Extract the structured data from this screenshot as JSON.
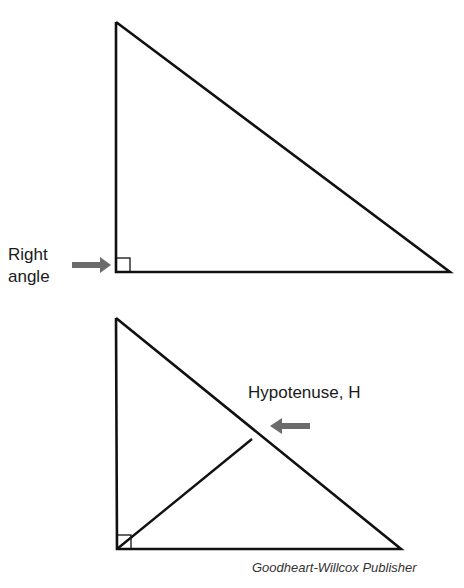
{
  "figure": {
    "top_diagram": {
      "label_line1": "Right",
      "label_line2": "angle",
      "vertices": {
        "top": [
          116,
          22
        ],
        "corner": [
          116,
          272
        ],
        "right": [
          450,
          272
        ]
      }
    },
    "bottom_diagram": {
      "label": "Hypotenuse, H",
      "vertices": {
        "top": [
          116,
          318
        ],
        "corner": [
          117,
          549
        ],
        "right": [
          401,
          549
        ]
      },
      "altitude_end": [
        252,
        439
      ]
    },
    "credit": "Goodheart-Willcox Publisher",
    "colors": {
      "line": "#111111",
      "arrow": "#6b6b6b"
    }
  }
}
